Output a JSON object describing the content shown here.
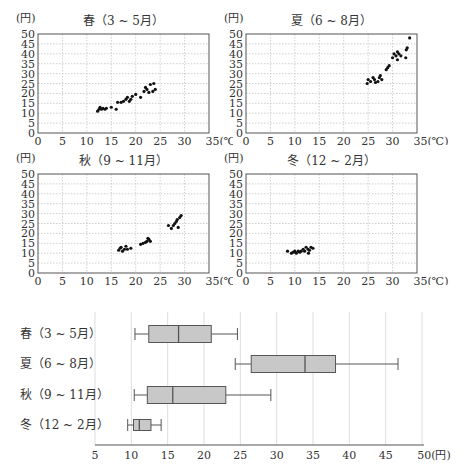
{
  "chart_data": [
    {
      "type": "scatter",
      "title": "春（3 ~ 5月）",
      "xlabel": "(℃)",
      "ylabel": "(円)",
      "xlim": [
        0,
        35
      ],
      "ylim": [
        0,
        50
      ],
      "xticks": [
        0,
        5,
        10,
        15,
        20,
        25,
        30,
        35
      ],
      "yticks": [
        0,
        5,
        10,
        15,
        20,
        25,
        30,
        35,
        40,
        45,
        50
      ],
      "grid": true,
      "points": [
        [
          12.2,
          11
        ],
        [
          12.5,
          12
        ],
        [
          12.7,
          13
        ],
        [
          13,
          12
        ],
        [
          13.3,
          12.5
        ],
        [
          13.7,
          12
        ],
        [
          14,
          12.5
        ],
        [
          15,
          13
        ],
        [
          16,
          12
        ],
        [
          16.3,
          15.5
        ],
        [
          17,
          15.5
        ],
        [
          17.5,
          16
        ],
        [
          18,
          17
        ],
        [
          18.3,
          18
        ],
        [
          18.7,
          16
        ],
        [
          19,
          17
        ],
        [
          19.3,
          18.5
        ],
        [
          20,
          19.5
        ],
        [
          21,
          18
        ],
        [
          21.7,
          21
        ],
        [
          22,
          23
        ],
        [
          22.3,
          22
        ],
        [
          22.7,
          20.5
        ],
        [
          23,
          24.5
        ],
        [
          23.7,
          25
        ],
        [
          24,
          22
        ],
        [
          23.5,
          21
        ]
      ]
    },
    {
      "type": "scatter",
      "title": "夏（6 ~ 8月）",
      "xlabel": "(℃)",
      "ylabel": "(円)",
      "xlim": [
        0,
        35
      ],
      "ylim": [
        0,
        50
      ],
      "xticks": [
        0,
        5,
        10,
        15,
        20,
        25,
        30,
        35
      ],
      "yticks": [
        0,
        5,
        10,
        15,
        20,
        25,
        30,
        35,
        40,
        45,
        50
      ],
      "grid": true,
      "points": [
        [
          24.8,
          25
        ],
        [
          25,
          27
        ],
        [
          25.5,
          26
        ],
        [
          26,
          28
        ],
        [
          26.3,
          27
        ],
        [
          26.5,
          25.5
        ],
        [
          27,
          26
        ],
        [
          27.3,
          28
        ],
        [
          27.5,
          29
        ],
        [
          27.8,
          27
        ],
        [
          28.7,
          32
        ],
        [
          29,
          33
        ],
        [
          29.3,
          34
        ],
        [
          30,
          38
        ],
        [
          30.3,
          40
        ],
        [
          30.7,
          39
        ],
        [
          31,
          41
        ],
        [
          31.3,
          40
        ],
        [
          31.7,
          39
        ],
        [
          31,
          37
        ],
        [
          32.7,
          38
        ],
        [
          32.8,
          42
        ],
        [
          33,
          43
        ],
        [
          33.5,
          48
        ]
      ]
    },
    {
      "type": "scatter",
      "title": "秋（9 ~ 11月）",
      "xlabel": "(℃)",
      "ylabel": "(円)",
      "xlim": [
        0,
        35
      ],
      "ylim": [
        0,
        50
      ],
      "xticks": [
        0,
        5,
        10,
        15,
        20,
        25,
        30,
        35
      ],
      "yticks": [
        0,
        5,
        10,
        15,
        20,
        25,
        30,
        35,
        40,
        45,
        50
      ],
      "grid": true,
      "points": [
        [
          16.5,
          11.5
        ],
        [
          16.8,
          12.5
        ],
        [
          17,
          13
        ],
        [
          17.3,
          11
        ],
        [
          17.7,
          12
        ],
        [
          18,
          13.5
        ],
        [
          18.3,
          12
        ],
        [
          19,
          12.5
        ],
        [
          21,
          14.5
        ],
        [
          21.5,
          15
        ],
        [
          22,
          15.5
        ],
        [
          22.3,
          16
        ],
        [
          22.7,
          17
        ],
        [
          23,
          16
        ],
        [
          22.5,
          17.5
        ],
        [
          26.7,
          24
        ],
        [
          27.3,
          22.5
        ],
        [
          27.7,
          24
        ],
        [
          28,
          25
        ],
        [
          28.3,
          26
        ],
        [
          28.7,
          23
        ],
        [
          29,
          28
        ],
        [
          29.3,
          29
        ],
        [
          28.5,
          27
        ]
      ]
    },
    {
      "type": "scatter",
      "title": "冬（12 ~ 2月）",
      "xlabel": "(℃)",
      "ylabel": "(円)",
      "xlim": [
        0,
        35
      ],
      "ylim": [
        0,
        50
      ],
      "xticks": [
        0,
        5,
        10,
        15,
        20,
        25,
        30,
        35
      ],
      "yticks": [
        0,
        5,
        10,
        15,
        20,
        25,
        30,
        35,
        40,
        45,
        50
      ],
      "grid": true,
      "points": [
        [
          8.5,
          11
        ],
        [
          9.3,
          10
        ],
        [
          9.7,
          10.5
        ],
        [
          10,
          11
        ],
        [
          10.3,
          10
        ],
        [
          10.7,
          11
        ],
        [
          11,
          10.5
        ],
        [
          11.3,
          11
        ],
        [
          11.7,
          12
        ],
        [
          12,
          11
        ],
        [
          12.3,
          13
        ],
        [
          12.7,
          12
        ],
        [
          13,
          11.5
        ],
        [
          13.3,
          13
        ],
        [
          13.7,
          12.5
        ],
        [
          12.8,
          10
        ]
      ]
    },
    {
      "type": "boxplot",
      "title": "",
      "xlabel": "(円)",
      "xlim": [
        5,
        50
      ],
      "xticks": [
        5,
        10,
        15,
        20,
        25,
        30,
        35,
        40,
        45,
        50
      ],
      "grid": true,
      "categories": [
        "春（3 ~ 5月）",
        "夏（6 ~ 8月）",
        "秋（9 ~ 11月）",
        "冬（12 ~ 2月）"
      ],
      "series": [
        {
          "name": "春（3 ~ 5月）",
          "min": 10.5,
          "q1": 12.4,
          "median": 16.5,
          "q3": 21.0,
          "max": 24.6
        },
        {
          "name": "夏（6 ~ 8月）",
          "min": 24.3,
          "q1": 26.5,
          "median": 33.9,
          "q3": 38.1,
          "max": 46.7
        },
        {
          "name": "秋（9 ~ 11月）",
          "min": 10.4,
          "q1": 12.2,
          "median": 15.7,
          "q3": 23.0,
          "max": 29.2
        },
        {
          "name": "冬（12 ~ 2月）",
          "min": 9.5,
          "q1": 10.3,
          "median": 11.1,
          "q3": 12.7,
          "max": 14.1
        }
      ]
    }
  ],
  "colors": {
    "axis": "#555555",
    "grid": "#bbbbbb",
    "point": "#111111",
    "box_fill": "#c8c8c8",
    "box_stroke": "#555555"
  }
}
